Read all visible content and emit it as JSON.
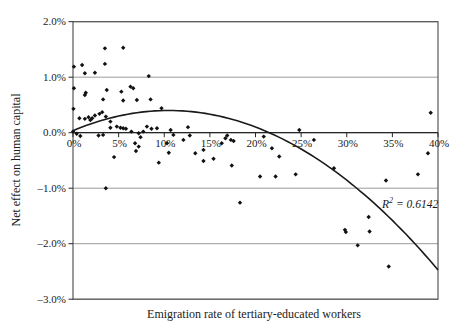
{
  "chart_data": {
    "type": "scatter",
    "title": "",
    "xlabel": "Emigration rate of tertiary-educated workers",
    "ylabel": "Net effect on human capital",
    "xlim": [
      0,
      40
    ],
    "ylim": [
      -3,
      2
    ],
    "x_ticks": [
      "0%",
      "5%",
      "10%",
      "15%",
      "20%",
      "25%",
      "30%",
      "35%",
      "40%"
    ],
    "x_tick_values": [
      0,
      5,
      10,
      15,
      20,
      25,
      30,
      35,
      40
    ],
    "y_ticks": [
      "2.0%",
      "1.0%",
      "0.0%",
      "–1.0%",
      "–2.0%",
      "–3.0%"
    ],
    "y_tick_values": [
      2,
      1,
      0,
      -1,
      -2,
      -3
    ],
    "grid": "horizontal",
    "legend": "none",
    "marker": "diamond",
    "points": [
      [
        0.0,
        0.02
      ],
      [
        0.05,
        0.43
      ],
      [
        0.1,
        0.8
      ],
      [
        0.1,
        1.19
      ],
      [
        0.4,
        -0.02
      ],
      [
        0.7,
        0.26
      ],
      [
        0.8,
        -0.06
      ],
      [
        1.0,
        1.22
      ],
      [
        1.3,
        1.07
      ],
      [
        1.3,
        0.68
      ],
      [
        1.3,
        0.25
      ],
      [
        1.4,
        0.72
      ],
      [
        1.7,
        0.28
      ],
      [
        1.9,
        0.23
      ],
      [
        2.1,
        0.26
      ],
      [
        2.4,
        1.08
      ],
      [
        2.4,
        0.31
      ],
      [
        2.8,
        -0.05
      ],
      [
        2.9,
        0.34
      ],
      [
        3.2,
        0.37
      ],
      [
        3.3,
        0.6
      ],
      [
        3.3,
        -0.04
      ],
      [
        3.5,
        1.52
      ],
      [
        3.5,
        1.24
      ],
      [
        3.6,
        0.29
      ],
      [
        3.6,
        -1.0
      ],
      [
        3.7,
        0.77
      ],
      [
        4.1,
        0.2
      ],
      [
        4.1,
        0.09
      ],
      [
        4.5,
        -0.44
      ],
      [
        4.8,
        0.11
      ],
      [
        5.2,
        0.09
      ],
      [
        5.3,
        0.74
      ],
      [
        5.5,
        1.53
      ],
      [
        5.5,
        0.58
      ],
      [
        5.5,
        0.08
      ],
      [
        5.8,
        0.07
      ],
      [
        6.3,
        0.83
      ],
      [
        6.4,
        0.02
      ],
      [
        6.6,
        0.8
      ],
      [
        6.8,
        -0.19
      ],
      [
        6.9,
        -0.33
      ],
      [
        7.0,
        0.59
      ],
      [
        7.2,
        -0.01
      ],
      [
        7.2,
        -0.25
      ],
      [
        7.4,
        -0.08
      ],
      [
        7.7,
        0.02
      ],
      [
        8.1,
        0.11
      ],
      [
        8.3,
        1.02
      ],
      [
        8.5,
        0.6
      ],
      [
        8.6,
        0.07
      ],
      [
        9.2,
        0.08
      ],
      [
        9.4,
        -0.54
      ],
      [
        9.7,
        0.44
      ],
      [
        10.3,
        -0.19
      ],
      [
        10.5,
        -0.36
      ],
      [
        10.7,
        0.05
      ],
      [
        11.0,
        -0.04
      ],
      [
        12.1,
        -0.13
      ],
      [
        12.6,
        0.1
      ],
      [
        12.8,
        -0.05
      ],
      [
        13.4,
        -0.37
      ],
      [
        14.3,
        -0.31
      ],
      [
        14.3,
        -0.51
      ],
      [
        15.4,
        -0.47
      ],
      [
        16.3,
        -0.19
      ],
      [
        16.7,
        -0.1
      ],
      [
        16.9,
        -0.05
      ],
      [
        17.3,
        -0.13
      ],
      [
        17.6,
        -0.15
      ],
      [
        17.4,
        -0.59
      ],
      [
        18.3,
        -1.26
      ],
      [
        20.5,
        -0.79
      ],
      [
        20.9,
        -0.07
      ],
      [
        21.8,
        -0.28
      ],
      [
        22.2,
        -0.79
      ],
      [
        22.6,
        -0.43
      ],
      [
        24.4,
        -0.75
      ],
      [
        24.8,
        0.05
      ],
      [
        26.4,
        -0.13
      ],
      [
        28.6,
        -0.64
      ],
      [
        29.8,
        -1.75
      ],
      [
        29.9,
        -1.79
      ],
      [
        31.2,
        -2.03
      ],
      [
        32.4,
        -1.52
      ],
      [
        32.5,
        -1.78
      ],
      [
        34.3,
        -0.86
      ],
      [
        34.6,
        -2.41
      ],
      [
        37.8,
        -0.75
      ],
      [
        38.9,
        -0.37
      ],
      [
        39.2,
        0.36
      ]
    ],
    "trendline": {
      "type": "quadratic",
      "vertex_x": 10.5,
      "vertex_y": 0.4,
      "coeff": -0.0033,
      "x_start": 0,
      "x_end": 40,
      "r_squared": "0.6142"
    },
    "annotation": {
      "r_base": "R",
      "r_exponent": "2",
      "r_value": " = 0.6142"
    },
    "colors": {
      "marker": "#111111",
      "line": "#1a1a1a",
      "grid": "#9b9b9b",
      "border": "#595959",
      "axis": "#262626",
      "text": "#1a1a1a",
      "background": "#ffffff"
    }
  }
}
